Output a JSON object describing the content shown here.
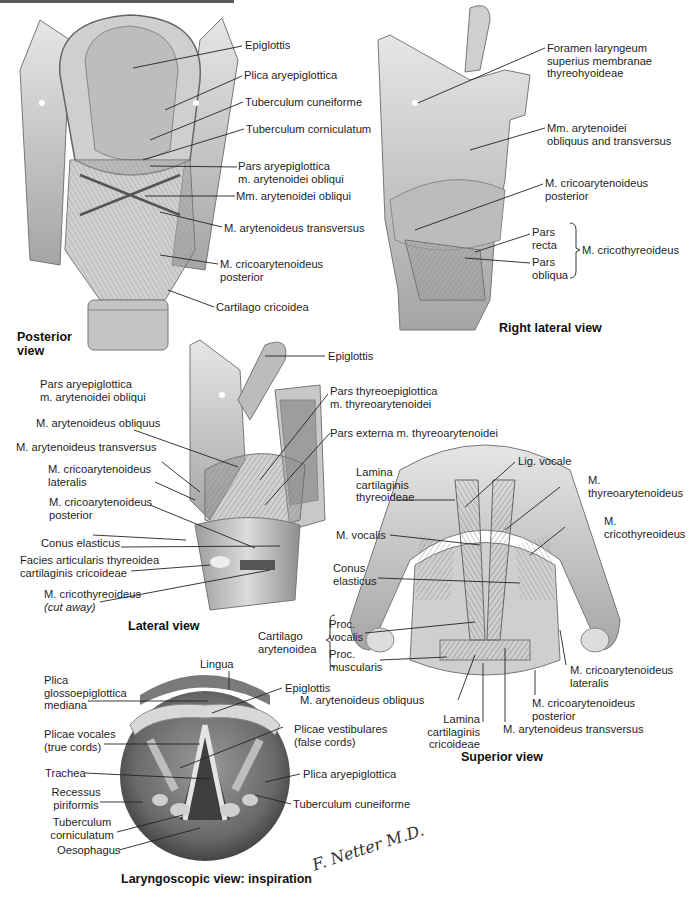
{
  "figure": {
    "style": "grayscale anatomical illustration plate",
    "signature": "F. Netter M.D."
  },
  "panels": {
    "posterior": {
      "title_line1": "Posterior",
      "title_line2": "view",
      "labels": {
        "epiglottis": "Epiglottis",
        "plica_aryepiglottica": "Plica aryepiglottica",
        "tuberculum_cuneiforme": "Tuberculum cuneiforme",
        "tuberculum_corniculatum": "Tuberculum corniculatum",
        "pars_aryepiglottica_1": "Pars aryepiglottica",
        "pars_aryepiglottica_2": "m. arytenoidei obliqui",
        "mm_arytenoidei_obliqui": "Mm. arytenoidei obliqui",
        "m_arytenoideus_transversus": "M. arytenoideus transversus",
        "m_cricoarytenoideus_posterior_1": "M. cricoarytenoideus",
        "m_cricoarytenoideus_posterior_2": "posterior",
        "cartilago_cricoidea": "Cartilago cricoidea"
      }
    },
    "right_lateral": {
      "title": "Right lateral view",
      "labels": {
        "foramen_1": "Foramen laryngeum",
        "foramen_2": "superius membranae",
        "foramen_3": "thyreohyoideae",
        "mm_arytenoidei_1": "Mm. arytenoidei",
        "mm_arytenoidei_2": "obliquus and transversus",
        "m_cricoarytenoideus_posterior_1": "M. cricoarytenoideus",
        "m_cricoarytenoideus_posterior_2": "posterior",
        "pars_recta_1": "Pars",
        "pars_recta_2": "recta",
        "pars_obliqua_1": "Pars",
        "pars_obliqua_2": "obliqua",
        "m_cricothyreoideus": "M. cricothyreoideus"
      }
    },
    "lateral": {
      "title": "Lateral view",
      "labels": {
        "epiglottis": "Epiglottis",
        "pars_aryepiglottica_1": "Pars aryepiglottica",
        "pars_aryepiglottica_2": "m. arytenoidei obliqui",
        "m_arytenoideus_obliquus": "M. arytenoideus obliquus",
        "m_arytenoideus_transversus": "M. arytenoideus transversus",
        "m_cricoarytenoideus_lateralis_1": "M. cricoarytenoideus",
        "m_cricoarytenoideus_lateralis_2": "lateralis",
        "m_cricoarytenoideus_posterior_1": "M. cricoarytenoideus",
        "m_cricoarytenoideus_posterior_2": "posterior",
        "conus_elasticus": "Conus elasticus",
        "facies_1": "Facies articularis thyreoidea",
        "facies_2": "cartilaginis cricoideae",
        "m_cricothyreoideus_1": "M. cricothyreoideus",
        "m_cricothyreoideus_2": "(cut away)",
        "pars_thyreoepiglottica_1": "Pars thyreoepiglottica",
        "pars_thyreoepiglottica_2": "m. thyreoarytenoidei",
        "pars_externa": "Pars externa m. thyreoarytenoidei"
      }
    },
    "superior": {
      "title": "Superior view",
      "labels": {
        "lamina_thyreoideae_1": "Lamina",
        "lamina_thyreoideae_2": "cartilaginis",
        "lamina_thyreoideae_3": "thyreoideae",
        "lig_vocale": "Lig. vocale",
        "m_thyreoarytenoideus_1": "M.",
        "m_thyreoarytenoideus_2": "thyreoarytenoideus",
        "m_cricothyreoideus_1": "M.",
        "m_cricothyreoideus_2": "cricothyreoideus",
        "m_vocalis": "M. vocalis",
        "conus_elasticus_1": "Conus",
        "conus_elasticus_2": "elasticus",
        "cartilago_arytenoidea_1": "Cartilago",
        "cartilago_arytenoidea_2": "arytenoidea",
        "proc_vocalis_1": "Proc.",
        "proc_vocalis_2": "vocalis",
        "proc_muscularis_1": "Proc.",
        "proc_muscularis_2": "muscularis",
        "m_cricoarytenoideus_lateralis_1": "M. cricoarytenoideus",
        "m_cricoarytenoideus_lateralis_2": "lateralis",
        "m_arytenoideus_obliquus": "M. arytenoideus obliquus",
        "m_cricoarytenoideus_posterior_1": "M. cricoarytenoideus",
        "m_cricoarytenoideus_posterior_2": "posterior",
        "lamina_cricoideae_1": "Lamina",
        "lamina_cricoideae_2": "cartilaginis",
        "lamina_cricoideae_3": "cricoideae",
        "m_arytenoideus_transversus": "M. arytenoideus transversus"
      }
    },
    "laryngoscopic": {
      "title": "Laryngoscopic view: inspiration",
      "labels": {
        "lingua": "Lingua",
        "plica_glosso_1": "Plica",
        "plica_glosso_2": "glossoepiglottica",
        "plica_glosso_3": "mediana",
        "epiglottis": "Epiglottis",
        "plicae_vocales_1": "Plicae vocales",
        "plicae_vocales_2": "(true cords)",
        "plicae_vestibulares_1": "Plicae vestibulares",
        "plicae_vestibulares_2": "(false cords)",
        "trachea": "Trachea",
        "plica_aryepiglottica": "Plica aryepiglottica",
        "recessus_1": "Recessus",
        "recessus_2": "piriformis",
        "tuberculum_cuneiforme": "Tuberculum cuneiforme",
        "tuberculum_corniculatum_1": "Tuberculum",
        "tuberculum_corniculatum_2": "corniculatum",
        "oesophagus": "Oesophagus"
      }
    }
  },
  "colors": {
    "text": "#1e1e1e",
    "leader_line": "#222222",
    "tissue_light": "#d9d9d9",
    "tissue_mid": "#a8a8a8",
    "tissue_dark": "#5e5e5e",
    "background": "#ffffff"
  }
}
